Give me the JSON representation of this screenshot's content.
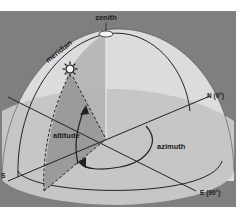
{
  "diagram": {
    "labels": {
      "zenith": "zenith",
      "meridian": "meridian",
      "altitude": "altitude",
      "azimuth": "azimuth",
      "north": "N (0°)",
      "east": "E (90°)",
      "south": "S",
      "west": "W"
    },
    "icons": {
      "sun": "sun-icon"
    },
    "colors": {
      "background": "#7f7f7f",
      "dome_upper": "#dcdcdc",
      "dome_lower": "#c6c6c6",
      "altitude_plane": "#9b9b9b",
      "meridian_plane": "#b4b4b4",
      "lines": "#222222"
    }
  }
}
